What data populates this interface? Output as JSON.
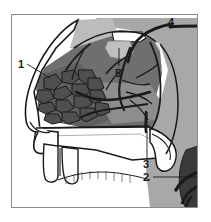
{
  "figure": {
    "frame": {
      "border_color": "#8a8a8a",
      "background": "#ffffff"
    },
    "palette": {
      "outline": "#1a1a1a",
      "tissue_light": "#c9c9c9",
      "tissue_mid": "#a8a8a8",
      "tissue_dark": "#6f6f6f",
      "plexus_dark": "#4f4f4f",
      "vessel": "#2b2b2b",
      "white": "#ffffff"
    },
    "labels": [
      {
        "id": "1",
        "text": "1",
        "x": 20,
        "y": 67,
        "target_x": 48,
        "target_y": 80,
        "name": "label-1-kiesselbach-plexus"
      },
      {
        "id": "2",
        "text": "2",
        "x": 146,
        "y": 180,
        "target_x": 196,
        "target_y": 180,
        "name": "label-2-maxillary-artery"
      },
      {
        "id": "3",
        "text": "3",
        "x": 146,
        "y": 167,
        "target_x": 146,
        "target_y": 112,
        "name": "label-3-descending-palatine-artery"
      },
      {
        "id": "4",
        "text": "4",
        "x": 171,
        "y": 25,
        "target_x": 148,
        "target_y": 33,
        "name": "label-4-sphenopalatine-artery"
      },
      {
        "id": "5",
        "text": "5",
        "x": 119,
        "y": 74,
        "target_x": 119,
        "target_y": 48,
        "name": "label-5-sphenopalatine-foramen"
      }
    ],
    "regions": [
      {
        "name": "nasal-septum-mucosa",
        "tone": "tissue_dark"
      },
      {
        "name": "superior-nasal-region",
        "tone": "tissue_mid"
      },
      {
        "name": "sphenoid-region",
        "tone": "tissue_light"
      },
      {
        "name": "kiesselbach-plexus",
        "tone": "plexus_dark"
      },
      {
        "name": "hard-palate",
        "tone": "white"
      },
      {
        "name": "upper-lip-and-teeth",
        "tone": "white"
      },
      {
        "name": "nasal-dorsum",
        "tone": "white"
      }
    ]
  }
}
